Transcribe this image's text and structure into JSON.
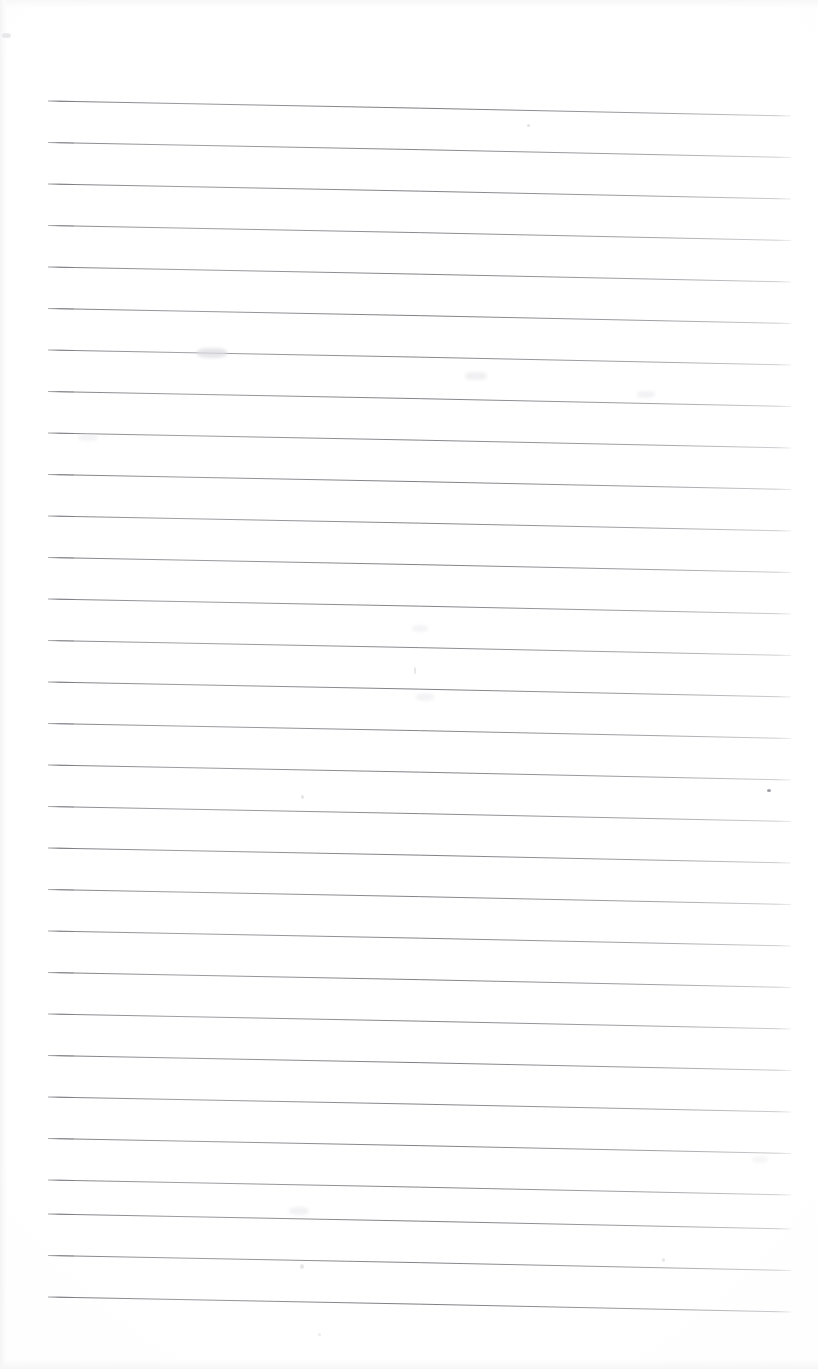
{
  "document": {
    "kind": "scanned-ruled-notebook-page",
    "page_width": 818,
    "page_height": 1369,
    "background_color": "#fefefe",
    "paper_tone_color": "#f8f8f9",
    "visible_text": "",
    "text_note": "No legible text, headings, labels or numbers are rendered anywhere on this page — it is a blank ruled sheet."
  },
  "rules": {
    "line_color": "#8d8d93",
    "line_color_strong": "#74747a",
    "line_color_faint": "#b9b9bf",
    "line_thickness_px": 1,
    "count": 30,
    "x_start": 48,
    "x_end": 791,
    "first_line_y_left": 101,
    "line_spacing_px": 41.5,
    "slope_drop_px": 15,
    "lines": [
      {
        "index": 1,
        "y_left": 101.0,
        "y_right": 116.0,
        "opacity": 0.95
      },
      {
        "index": 2,
        "y_left": 142.5,
        "y_right": 157.5,
        "opacity": 0.88
      },
      {
        "index": 3,
        "y_left": 184.0,
        "y_right": 199.0,
        "opacity": 0.92
      },
      {
        "index": 4,
        "y_left": 225.5,
        "y_right": 240.5,
        "opacity": 0.86
      },
      {
        "index": 5,
        "y_left": 267.0,
        "y_right": 282.0,
        "opacity": 0.9
      },
      {
        "index": 6,
        "y_left": 308.5,
        "y_right": 323.5,
        "opacity": 0.93
      },
      {
        "index": 7,
        "y_left": 350.0,
        "y_right": 365.0,
        "opacity": 0.87
      },
      {
        "index": 8,
        "y_left": 391.5,
        "y_right": 406.5,
        "opacity": 0.91
      },
      {
        "index": 9,
        "y_left": 433.0,
        "y_right": 448.0,
        "opacity": 0.89
      },
      {
        "index": 10,
        "y_left": 474.5,
        "y_right": 489.5,
        "opacity": 0.94
      },
      {
        "index": 11,
        "y_left": 516.0,
        "y_right": 531.0,
        "opacity": 0.88
      },
      {
        "index": 12,
        "y_left": 557.5,
        "y_right": 572.5,
        "opacity": 0.92
      },
      {
        "index": 13,
        "y_left": 599.0,
        "y_right": 614.0,
        "opacity": 0.9
      },
      {
        "index": 14,
        "y_left": 640.5,
        "y_right": 655.5,
        "opacity": 0.86
      },
      {
        "index": 15,
        "y_left": 682.0,
        "y_right": 697.0,
        "opacity": 0.93
      },
      {
        "index": 16,
        "y_left": 723.5,
        "y_right": 738.5,
        "opacity": 0.89
      },
      {
        "index": 17,
        "y_left": 765.0,
        "y_right": 780.0,
        "opacity": 0.91
      },
      {
        "index": 18,
        "y_left": 806.5,
        "y_right": 821.5,
        "opacity": 0.87
      },
      {
        "index": 19,
        "y_left": 848.0,
        "y_right": 863.0,
        "opacity": 0.93
      },
      {
        "index": 20,
        "y_left": 889.5,
        "y_right": 904.5,
        "opacity": 0.9
      },
      {
        "index": 21,
        "y_left": 931.0,
        "y_right": 946.0,
        "opacity": 0.88
      },
      {
        "index": 22,
        "y_left": 972.5,
        "y_right": 987.5,
        "opacity": 0.92
      },
      {
        "index": 23,
        "y_left": 1014.0,
        "y_right": 1029.0,
        "opacity": 0.89
      },
      {
        "index": 24,
        "y_left": 1055.5,
        "y_right": 1070.5,
        "opacity": 0.94
      },
      {
        "index": 25,
        "y_left": 1097.0,
        "y_right": 1112.0,
        "opacity": 0.9
      },
      {
        "index": 26,
        "y_left": 1138.5,
        "y_right": 1153.5,
        "opacity": 0.92
      },
      {
        "index": 27,
        "y_left": 1180.0,
        "y_right": 1195.0,
        "opacity": 0.88
      },
      {
        "index": 28,
        "y_left": 1214.0,
        "y_right": 1229.0,
        "opacity": 0.93
      },
      {
        "index": 29,
        "y_left": 1255.5,
        "y_right": 1270.5,
        "opacity": 0.91
      },
      {
        "index": 30,
        "y_left": 1297.0,
        "y_right": 1312.0,
        "opacity": 0.95
      }
    ]
  },
  "artifacts": {
    "specks": [
      {
        "name": "speck-upper-center",
        "x": 527,
        "y": 124,
        "w": 3,
        "h": 3,
        "color": "#c9c9cf",
        "opacity": 0.55
      },
      {
        "name": "speck-right-mid",
        "x": 767,
        "y": 789,
        "w": 4,
        "h": 3,
        "color": "#7e7e86",
        "opacity": 0.75
      },
      {
        "name": "speck-left-upper",
        "x": 2,
        "y": 33,
        "w": 9,
        "h": 5,
        "color": "#e2e2e6",
        "opacity": 0.8
      },
      {
        "name": "speck-center-upper",
        "x": 301,
        "y": 795,
        "w": 3,
        "h": 4,
        "color": "#cdcdd3",
        "opacity": 0.5
      },
      {
        "name": "speck-center-lower",
        "x": 414,
        "y": 667,
        "w": 2,
        "h": 7,
        "color": "#cacad0",
        "opacity": 0.45
      },
      {
        "name": "speck-bottom-right",
        "x": 668,
        "y": 1437,
        "w": 3,
        "h": 3,
        "color": "#d0d0d6",
        "opacity": 0.4
      },
      {
        "name": "speck-lower-right",
        "x": 662,
        "y": 1258,
        "w": 3,
        "h": 4,
        "color": "#cacad0",
        "opacity": 0.45
      },
      {
        "name": "speck-bottom-mid",
        "x": 318,
        "y": 1333,
        "w": 3,
        "h": 3,
        "color": "#d2d2d8",
        "opacity": 0.4
      },
      {
        "name": "speck-lower-pencil",
        "x": 300,
        "y": 1264,
        "w": 4,
        "h": 5,
        "color": "#c6c6cc",
        "opacity": 0.4
      }
    ],
    "smudges": [
      {
        "name": "smudge-pencil-upper-left",
        "x": 197,
        "y": 348,
        "w": 30,
        "h": 10,
        "color": "#dcdce1",
        "opacity": 0.7,
        "blur": 1.6
      },
      {
        "name": "smudge-pencil-upper-right",
        "x": 465,
        "y": 372,
        "w": 22,
        "h": 8,
        "color": "#e4e4e8",
        "opacity": 0.55,
        "blur": 1.8
      },
      {
        "name": "smudge-pencil-far-right",
        "x": 637,
        "y": 391,
        "w": 18,
        "h": 7,
        "color": "#e6e6ea",
        "opacity": 0.5,
        "blur": 1.8
      },
      {
        "name": "smudge-pencil-left-mid",
        "x": 78,
        "y": 434,
        "w": 20,
        "h": 7,
        "color": "#e7e7eb",
        "opacity": 0.45,
        "blur": 1.8
      },
      {
        "name": "smudge-pencil-center",
        "x": 412,
        "y": 625,
        "w": 16,
        "h": 7,
        "color": "#e8e8ec",
        "opacity": 0.45,
        "blur": 1.8
      },
      {
        "name": "smudge-pencil-lower",
        "x": 416,
        "y": 693,
        "w": 18,
        "h": 8,
        "color": "#e6e6ea",
        "opacity": 0.45,
        "blur": 1.8
      },
      {
        "name": "smudge-pencil-bottom",
        "x": 289,
        "y": 1207,
        "w": 20,
        "h": 8,
        "color": "#e5e5e9",
        "opacity": 0.5,
        "blur": 1.8
      },
      {
        "name": "smudge-pencil-right-low",
        "x": 752,
        "y": 1156,
        "w": 16,
        "h": 7,
        "color": "#e9e9ed",
        "opacity": 0.4,
        "blur": 1.8
      }
    ]
  }
}
